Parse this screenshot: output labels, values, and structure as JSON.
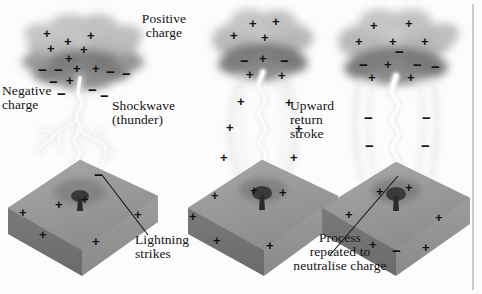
{
  "figure": {
    "type": "illustration",
    "background_color": "#fcfcfc",
    "ink_color": "#141414",
    "panel_count": 3
  },
  "labels": {
    "positive_charge": "Positive\ncharge",
    "negative_charge": "Negative\ncharge",
    "shockwave": "Shockwave\n(thunder)",
    "upward_return": "Upward\nreturn\nstroke",
    "lightning_strikes": "Lightning\nstrikes",
    "process_repeated": "Process\nrepeated to\nneutralise charge"
  },
  "symbols": {
    "plus": "+",
    "minus": "−"
  },
  "panels": [
    {
      "id": "panel-1",
      "stage_label": "Lightning strikes",
      "cloud": {
        "positive_charges": 6,
        "negative_charges": 9
      },
      "ground": {
        "positive_charges": 6,
        "feature": "tree"
      },
      "bolt": "branched stepped leader"
    },
    {
      "id": "panel-2",
      "stage_label": "Shockwave (thunder)",
      "cloud": {
        "positive_charges": 4,
        "negative_charges": 5
      },
      "ground": {
        "positive_charges": 7,
        "feature": "tree"
      },
      "bolt": "single channel with shockwave halo"
    },
    {
      "id": "panel-3",
      "stage_label": "Upward return stroke",
      "cloud": {
        "positive_charges": 6,
        "negative_charges": 5
      },
      "ground": {
        "positive_charges": 7,
        "feature": "tree"
      },
      "bolt": "upward return stroke with streamers"
    }
  ],
  "charge_marks": {
    "panel1_cloud": [
      {
        "s": "+",
        "x": 46,
        "y": 32
      },
      {
        "s": "+",
        "x": 67,
        "y": 40
      },
      {
        "s": "+",
        "x": 88,
        "y": 34
      },
      {
        "s": "+",
        "x": 50,
        "y": 47
      },
      {
        "s": "+",
        "x": 82,
        "y": 48
      },
      {
        "s": "+",
        "x": 68,
        "y": 55
      },
      {
        "s": "−",
        "x": 41,
        "y": 74
      },
      {
        "s": "−",
        "x": 56,
        "y": 74
      },
      {
        "s": "−",
        "x": 72,
        "y": 70
      },
      {
        "s": "+",
        "x": 78,
        "y": 70
      },
      {
        "s": "+",
        "x": 97,
        "y": 70
      },
      {
        "s": "−",
        "x": 109,
        "y": 72
      },
      {
        "s": "−",
        "x": 124,
        "y": 76
      },
      {
        "s": "+",
        "x": 70,
        "y": 84
      },
      {
        "s": "−",
        "x": 52,
        "y": 84
      },
      {
        "s": "−",
        "x": 90,
        "y": 90
      },
      {
        "s": "−",
        "x": 60,
        "y": 96
      },
      {
        "s": "−",
        "x": 104,
        "y": 96
      }
    ],
    "panel1_ground": [
      {
        "s": "−",
        "x": 97,
        "y": 174
      },
      {
        "s": "+",
        "x": 58,
        "y": 205
      },
      {
        "s": "+",
        "x": 22,
        "y": 213
      },
      {
        "s": "+",
        "x": 42,
        "y": 235
      },
      {
        "s": "+",
        "x": 95,
        "y": 242
      },
      {
        "s": "+",
        "x": 137,
        "y": 215
      },
      {
        "s": "+",
        "x": 84,
        "y": 200
      }
    ],
    "panel2_cloud": [
      {
        "s": "+",
        "x": 252,
        "y": 22
      },
      {
        "s": "+",
        "x": 275,
        "y": 20
      },
      {
        "s": "+",
        "x": 264,
        "y": 36
      },
      {
        "s": "+",
        "x": 233,
        "y": 34
      },
      {
        "s": "−",
        "x": 243,
        "y": 63
      },
      {
        "s": "−",
        "x": 262,
        "y": 62
      },
      {
        "s": "−",
        "x": 283,
        "y": 64
      },
      {
        "s": "+",
        "x": 249,
        "y": 77
      },
      {
        "s": "+",
        "x": 281,
        "y": 78
      },
      {
        "s": "+",
        "x": 265,
        "y": 74
      }
    ],
    "panel2_ground": [
      {
        "s": "+",
        "x": 240,
        "y": 103
      },
      {
        "s": "+",
        "x": 287,
        "y": 104
      },
      {
        "s": "+",
        "x": 228,
        "y": 128
      },
      {
        "s": "+",
        "x": 297,
        "y": 129
      },
      {
        "s": "+",
        "x": 222,
        "y": 158
      },
      {
        "s": "+",
        "x": 292,
        "y": 158
      },
      {
        "s": "+",
        "x": 213,
        "y": 196
      },
      {
        "s": "+",
        "x": 253,
        "y": 190
      },
      {
        "s": "+",
        "x": 281,
        "y": 192
      },
      {
        "s": "+",
        "x": 191,
        "y": 216
      },
      {
        "s": "+",
        "x": 215,
        "y": 240
      },
      {
        "s": "+",
        "x": 268,
        "y": 245
      }
    ],
    "panel3_cloud": [
      {
        "s": "+",
        "x": 373,
        "y": 24
      },
      {
        "s": "+",
        "x": 408,
        "y": 22
      },
      {
        "s": "+",
        "x": 358,
        "y": 40
      },
      {
        "s": "+",
        "x": 392,
        "y": 40
      },
      {
        "s": "+",
        "x": 424,
        "y": 40
      },
      {
        "s": "−",
        "x": 398,
        "y": 53
      },
      {
        "s": "−",
        "x": 362,
        "y": 66
      },
      {
        "s": "+",
        "x": 387,
        "y": 66
      },
      {
        "s": "−",
        "x": 416,
        "y": 66
      },
      {
        "s": "−",
        "x": 434,
        "y": 68
      },
      {
        "s": "+",
        "x": 371,
        "y": 80
      },
      {
        "s": "+",
        "x": 410,
        "y": 80
      }
    ],
    "panel3_ground": [
      {
        "s": "−",
        "x": 367,
        "y": 118
      },
      {
        "s": "−",
        "x": 425,
        "y": 118
      },
      {
        "s": "−",
        "x": 368,
        "y": 146
      },
      {
        "s": "−",
        "x": 424,
        "y": 146
      },
      {
        "s": "+",
        "x": 379,
        "y": 192
      },
      {
        "s": "+",
        "x": 408,
        "y": 188
      },
      {
        "s": "+",
        "x": 393,
        "y": 200
      },
      {
        "s": "+",
        "x": 348,
        "y": 215
      },
      {
        "s": "+",
        "x": 438,
        "y": 218
      },
      {
        "s": "+",
        "x": 372,
        "y": 245
      },
      {
        "s": "+",
        "x": 425,
        "y": 248
      }
    ]
  },
  "leader_lines": [
    {
      "name": "lightning-strikes-leader",
      "x1": 102,
      "y1": 175,
      "x2": 148,
      "y2": 235
    },
    {
      "name": "process-repeated-leader",
      "x1": 398,
      "y1": 176,
      "x2": 330,
      "y2": 255
    }
  ],
  "border": {
    "right_rule_x": 473
  }
}
